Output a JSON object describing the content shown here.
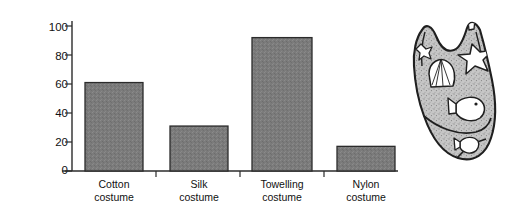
{
  "chart_data": {
    "type": "bar",
    "title": "",
    "subtitle": "",
    "xlabel": "",
    "ylabel": "Drying time in minutes",
    "categories": [
      "Cotton costume",
      "Silk costume",
      "Towelling costume",
      "Nylon costume"
    ],
    "category_lines": [
      [
        "Cotton",
        "costume"
      ],
      [
        "Silk",
        "costume"
      ],
      [
        "Towelling",
        "costume"
      ],
      [
        "Nylon",
        "costume"
      ]
    ],
    "values": [
      61,
      31,
      92,
      17
    ],
    "ylim": [
      0,
      100
    ],
    "yticks": [
      0,
      20,
      40,
      60,
      80,
      100
    ],
    "ytick_labels": [
      "0",
      "20",
      "40",
      "60",
      "80",
      "100"
    ],
    "grid": false,
    "legend": "none",
    "bar_color": "#7b7b7b",
    "bar_edge_color": "#2b2b2b",
    "axis_color": "#2b2b2b"
  },
  "illustration": {
    "name": "swimming-costume",
    "description": "Patterned swimming costume with shell, starfish and fish motifs",
    "body_color": "#b9b9b9",
    "outline_color": "#1f1f1f",
    "motif_color": "#ffffff"
  }
}
